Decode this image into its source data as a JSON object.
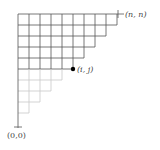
{
  "diagram": {
    "type": "staircase-lattice",
    "labels": {
      "top_right": "(n, n)",
      "point": "(i, j)",
      "origin": "(0,0)"
    },
    "grid": {
      "cell_size": 11,
      "origin_x": 18,
      "top_y": 14,
      "rows": 9,
      "dark_rows": 5,
      "dark_color": "#555555",
      "light_color": "#c8c8c8"
    },
    "point": {
      "col": 5,
      "row": 5,
      "color": "#000000"
    }
  }
}
